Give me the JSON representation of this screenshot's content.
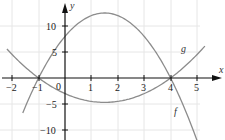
{
  "chart_data": {
    "type": "line",
    "title": "",
    "xlabel": "x",
    "ylabel": "y",
    "xlim": [
      -2.5,
      5.8
    ],
    "ylim": [
      -11.5,
      14.5
    ],
    "grid": true,
    "x_ticks": [
      -2,
      -1,
      0,
      1,
      2,
      3,
      4,
      5
    ],
    "x_tick_labels": [
      "−2",
      "−1",
      "0",
      "1",
      "2",
      "3",
      "4",
      "5"
    ],
    "y_ticks": [
      10,
      5,
      -5,
      -10
    ],
    "y_tick_labels": [
      "10",
      "5",
      "−5",
      "−10"
    ],
    "series": [
      {
        "name": "f",
        "formula": "-2x^2 + 6x + 8",
        "x": [
          -1.6,
          -1,
          0,
          1,
          1.5,
          2,
          3,
          4,
          5
        ],
        "values": [
          -5.12,
          0,
          8,
          12,
          12.5,
          12,
          8,
          0,
          -12
        ],
        "color": "#8c8c8c"
      },
      {
        "name": "g",
        "formula": "0.75x^2 - 2.25x - 3",
        "x": [
          -2.2,
          -1,
          0,
          1,
          1.5,
          2,
          3,
          4,
          5.3
        ],
        "values": [
          5.58,
          0,
          -3,
          -4.5,
          -4.69,
          -4.5,
          -3,
          0,
          5.15
        ],
        "color": "#8c8c8c"
      }
    ],
    "annotations": [
      {
        "text": "f",
        "x": 4.3,
        "y": -6.5
      },
      {
        "text": "g",
        "x": 4.4,
        "y": 5.0
      }
    ],
    "intersections": [
      [
        -1,
        0
      ],
      [
        4,
        0
      ]
    ]
  },
  "labels": {
    "x_axis": "x",
    "y_axis": "y",
    "f": "f",
    "g": "g",
    "origin": "0",
    "xt": [
      "−2",
      "−1",
      "1",
      "2",
      "3",
      "4",
      "5"
    ],
    "yt": [
      "10",
      "5",
      "−5",
      "−10"
    ]
  }
}
